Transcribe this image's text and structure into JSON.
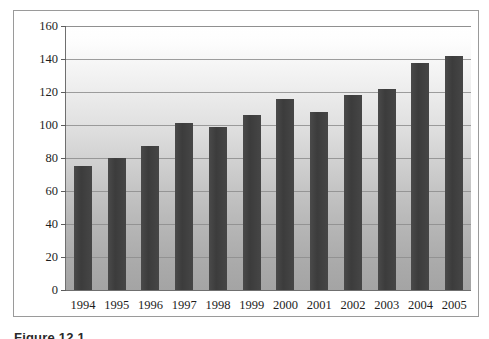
{
  "figure": {
    "caption": "Figure 12.1"
  },
  "chart_data": {
    "type": "bar",
    "title": "",
    "subtitle": "",
    "xlabel": "",
    "ylabel": "",
    "categories": [
      "1994",
      "1995",
      "1996",
      "1997",
      "1998",
      "1999",
      "2000",
      "2001",
      "2002",
      "2003",
      "2004",
      "2005"
    ],
    "values": [
      75,
      80,
      87,
      101,
      99,
      106,
      116,
      108,
      118,
      122,
      137.5,
      142
    ],
    "series": [
      {
        "name": "",
        "values": [
          75,
          80,
          87,
          101,
          99,
          106,
          116,
          108,
          118,
          122,
          137.5,
          142
        ]
      }
    ],
    "ylim": [
      0,
      160
    ],
    "yticks": [
      0,
      20,
      40,
      60,
      80,
      100,
      120,
      140,
      160
    ],
    "ytick_labels": [
      "0",
      "20",
      "40",
      "60",
      "80",
      "100",
      "120",
      "140",
      "160"
    ],
    "xtick_labels": [
      "1994",
      "1995",
      "1996",
      "1997",
      "1998",
      "1999",
      "2000",
      "2001",
      "2002",
      "2003",
      "2004",
      "2005"
    ],
    "grid": true,
    "grid_axis": "y",
    "legend": false,
    "legend_position": "none",
    "bar_color": "#414141",
    "plot_background": "vertical-gradient-white-to-gray",
    "axis_color": "#6f6f6f",
    "gridline_color": "#8d8d8d"
  }
}
